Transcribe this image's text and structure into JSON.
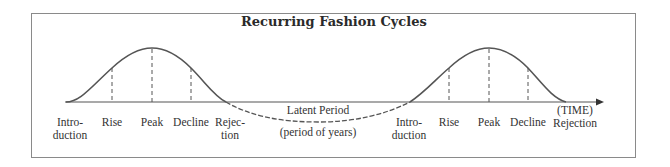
{
  "title": "Recurring Fashion Cycles",
  "colors": {
    "line": "#555555",
    "border": "#8a8a8a",
    "text": "#333333"
  },
  "axis": {
    "label_top": "(TIME)",
    "label_bottom": "Rejection",
    "arrow": "arrow-right-icon"
  },
  "cycle1": {
    "stages": [
      {
        "line1": "Intro-",
        "line2": "duction"
      },
      {
        "line1": "Rise",
        "line2": ""
      },
      {
        "line1": "Peak",
        "line2": ""
      },
      {
        "line1": "Decline",
        "line2": ""
      },
      {
        "line1": "Rejec-",
        "line2": "tion"
      }
    ]
  },
  "latent": {
    "label": "Latent Period",
    "sublabel": "(period of years)"
  },
  "cycle2": {
    "stages": [
      {
        "line1": "Intro-",
        "line2": "duction"
      },
      {
        "line1": "Rise",
        "line2": ""
      },
      {
        "line1": "Peak",
        "line2": ""
      },
      {
        "line1": "Decline",
        "line2": ""
      }
    ]
  }
}
